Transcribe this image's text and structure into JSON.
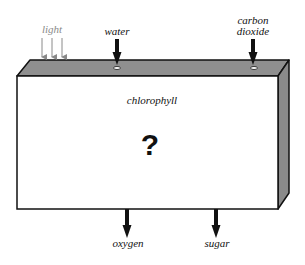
{
  "diagram": {
    "box": {
      "label": "chlorophyll",
      "center_symbol": "?",
      "front_color": "#ffffff",
      "top_color": "#8f8f8f",
      "side_color": "#8a8a8a",
      "outline_color": "#111111"
    },
    "inputs": [
      {
        "id": "light",
        "label": "light",
        "arrow_style": "thin-triple",
        "color": "#8a8a8a"
      },
      {
        "id": "water",
        "label": "water",
        "arrow_style": "thick",
        "color": "#111111"
      },
      {
        "id": "carbon-dioxide",
        "label_line1": "carbon",
        "label_line2": "dioxide",
        "arrow_style": "thick",
        "color": "#111111"
      }
    ],
    "outputs": [
      {
        "id": "oxygen",
        "label": "oxygen",
        "arrow_style": "thick",
        "color": "#111111"
      },
      {
        "id": "sugar",
        "label": "sugar",
        "arrow_style": "thick",
        "color": "#111111"
      }
    ]
  }
}
